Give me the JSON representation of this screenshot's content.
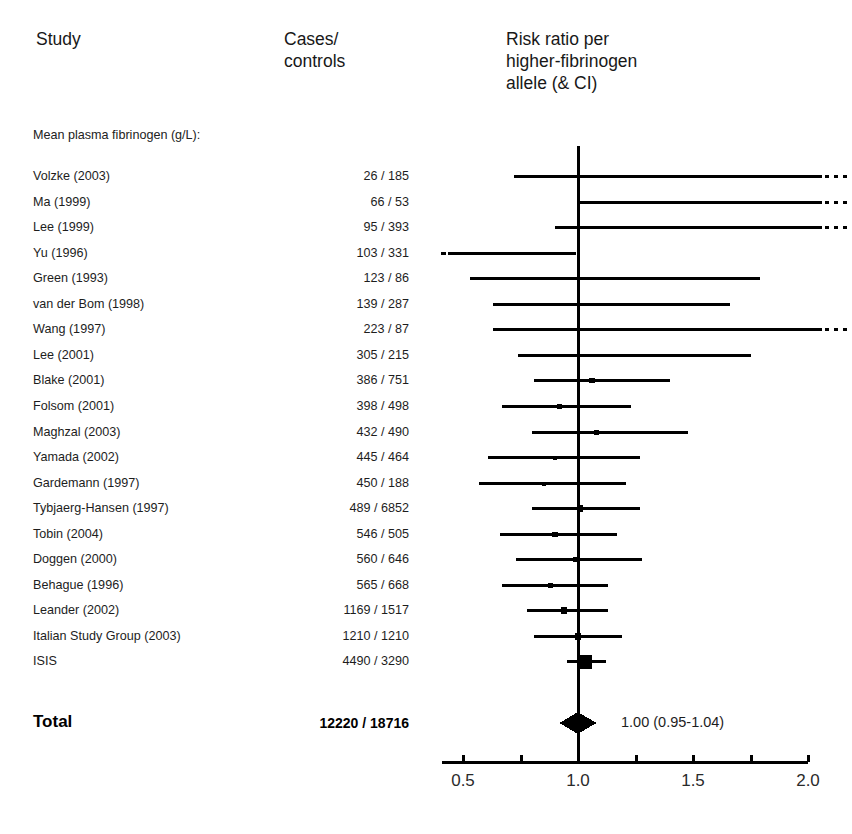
{
  "header": {
    "study_label": "Study",
    "cases_label": "Cases/\ncontrols",
    "rr_label": "Risk ratio per\nhigher-fibrinogen\nallele (& CI)"
  },
  "subgroup_caption": "Mean plasma fibrinogen (g/L):",
  "total": {
    "label": "Total",
    "cases": "12220 / 18716",
    "estimate_text": "1.00 (0.95-1.04)"
  },
  "axis": {
    "ticks": [
      "0.5",
      "1.0",
      "1.5",
      "2.0"
    ],
    "tick_values": [
      0.5,
      1.0,
      1.5,
      2.0
    ],
    "null_line": 1.0,
    "minor_ticks": [
      0.5,
      0.75,
      1.0,
      1.25,
      1.5,
      1.75,
      2.0
    ]
  },
  "colors": {
    "ink": "#000000",
    "text": "#1d1d1d",
    "background": "#ffffff"
  },
  "chart_data": {
    "type": "forest",
    "title": "Risk ratio per higher-fibrinogen allele (& CI)",
    "xlabel": "",
    "ylabel": "Study",
    "xlim": [
      0.41,
      2.08
    ],
    "xscale": "linear",
    "null_value": 1.0,
    "grid": false,
    "legend": "none",
    "columns": [
      "Study",
      "Cases/controls",
      "Risk ratio per higher-fibrinogen allele (& CI)"
    ],
    "subgroup": "Mean plasma fibrinogen (g/L):",
    "rows": [
      {
        "study": "Volzke (2003)",
        "cases": "26 / 185",
        "n_cases": 26,
        "n_controls": 185,
        "rr": 1.12,
        "ci_low": 0.72,
        "ci_high": 2.3,
        "truncated_high": true,
        "truncated_low": false,
        "marker": 0.0
      },
      {
        "study": "Ma (1999)",
        "cases": "66 / 53",
        "n_cases": 66,
        "n_controls": 53,
        "rr": 1.3,
        "ci_low": 1.0,
        "ci_high": 2.3,
        "truncated_high": true,
        "truncated_low": false,
        "marker": 0.0
      },
      {
        "study": "Lee (1999)",
        "cases": "95 / 393",
        "n_cases": 95,
        "n_controls": 393,
        "rr": 1.5,
        "ci_low": 0.9,
        "ci_high": 2.3,
        "truncated_high": true,
        "truncated_low": false,
        "marker": 3.0
      },
      {
        "study": "Yu (1996)",
        "cases": "103 / 331",
        "n_cases": 103,
        "n_controls": 331,
        "rr": 0.58,
        "ci_low": 0.41,
        "ci_high": 0.99,
        "truncated_high": false,
        "truncated_low": true,
        "marker": 3.6
      },
      {
        "study": "Green (1993)",
        "cases": "123 / 86",
        "n_cases": 123,
        "n_controls": 86,
        "rr": 1.0,
        "ci_low": 0.53,
        "ci_high": 1.79,
        "truncated_high": false,
        "truncated_low": false,
        "marker": 2.6
      },
      {
        "study": "van der Bom (1998)",
        "cases": "139 / 287",
        "n_cases": 139,
        "n_controls": 287,
        "rr": 1.02,
        "ci_low": 0.63,
        "ci_high": 1.66,
        "truncated_high": false,
        "truncated_low": false,
        "marker": 3.2
      },
      {
        "study": "Wang (1997)",
        "cases": "223 / 87",
        "n_cases": 223,
        "n_controls": 87,
        "rr": 1.14,
        "ci_low": 0.63,
        "ci_high": 2.3,
        "truncated_high": true,
        "truncated_low": false,
        "marker": 3.4
      },
      {
        "study": "Lee (2001)",
        "cases": "305 / 215",
        "n_cases": 305,
        "n_controls": 215,
        "rr": 1.12,
        "ci_low": 0.74,
        "ci_high": 1.75,
        "truncated_high": false,
        "truncated_low": false,
        "marker": 3.6
      },
      {
        "study": "Blake (2001)",
        "cases": "386 / 751",
        "n_cases": 386,
        "n_controls": 751,
        "rr": 1.06,
        "ci_low": 0.81,
        "ci_high": 1.4,
        "truncated_high": false,
        "truncated_low": false,
        "marker": 5.4
      },
      {
        "study": "Folsom (2001)",
        "cases": "398 / 498",
        "n_cases": 398,
        "n_controls": 498,
        "rr": 0.92,
        "ci_low": 0.67,
        "ci_high": 1.23,
        "truncated_high": false,
        "truncated_low": false,
        "marker": 5.4
      },
      {
        "study": "Maghzal (2003)",
        "cases": "432 / 490",
        "n_cases": 432,
        "n_controls": 490,
        "rr": 1.08,
        "ci_low": 0.8,
        "ci_high": 1.48,
        "truncated_high": false,
        "truncated_low": false,
        "marker": 5.2
      },
      {
        "study": "Yamada (2002)",
        "cases": "445 / 464",
        "n_cases": 445,
        "n_controls": 464,
        "rr": 0.9,
        "ci_low": 0.61,
        "ci_high": 1.27,
        "truncated_high": false,
        "truncated_low": false,
        "marker": 4.0
      },
      {
        "study": "Gardemann (1997)",
        "cases": "450 / 188",
        "n_cases": 450,
        "n_controls": 188,
        "rr": 0.85,
        "ci_low": 0.57,
        "ci_high": 1.21,
        "truncated_high": false,
        "truncated_low": false,
        "marker": 4.0
      },
      {
        "study": "Tybjaerg-Hansen (1997)",
        "cases": "489 / 6852",
        "n_cases": 489,
        "n_controls": 6852,
        "rr": 1.01,
        "ci_low": 0.8,
        "ci_high": 1.27,
        "truncated_high": false,
        "truncated_low": false,
        "marker": 6.2
      },
      {
        "study": "Tobin (2004)",
        "cases": "546 / 505",
        "n_cases": 546,
        "n_controls": 505,
        "rr": 0.9,
        "ci_low": 0.66,
        "ci_high": 1.17,
        "truncated_high": false,
        "truncated_low": false,
        "marker": 5.2
      },
      {
        "study": "Doggen (2000)",
        "cases": "560 / 646",
        "n_cases": 560,
        "n_controls": 646,
        "rr": 0.99,
        "ci_low": 0.73,
        "ci_high": 1.28,
        "truncated_high": false,
        "truncated_low": false,
        "marker": 4.8
      },
      {
        "study": "Behague (1996)",
        "cases": "565 / 668",
        "n_cases": 565,
        "n_controls": 668,
        "rr": 0.88,
        "ci_low": 0.67,
        "ci_high": 1.13,
        "truncated_high": false,
        "truncated_low": false,
        "marker": 5.6
      },
      {
        "study": "Leander (2002)",
        "cases": "1169 / 1517",
        "n_cases": 1169,
        "n_controls": 1517,
        "rr": 0.94,
        "ci_low": 0.78,
        "ci_high": 1.13,
        "truncated_high": false,
        "truncated_low": false,
        "marker": 6.4
      },
      {
        "study": "Italian Study Group (2003)",
        "cases": "1210 / 1210",
        "n_cases": 1210,
        "n_controls": 1210,
        "rr": 1.0,
        "ci_low": 0.81,
        "ci_high": 1.19,
        "truncated_high": false,
        "truncated_low": false,
        "marker": 6.6
      },
      {
        "study": "ISIS",
        "cases": "4490 / 3290",
        "n_cases": 4490,
        "n_controls": 3290,
        "rr": 1.03,
        "ci_low": 0.95,
        "ci_high": 1.12,
        "truncated_high": false,
        "truncated_low": false,
        "marker": 14.0
      }
    ],
    "summary": {
      "label": "Total",
      "cases": "12220 / 18716",
      "rr": 1.0,
      "ci_low": 0.95,
      "ci_high": 1.04,
      "text": "1.00 (0.95-1.04)",
      "marker": "diamond"
    }
  }
}
